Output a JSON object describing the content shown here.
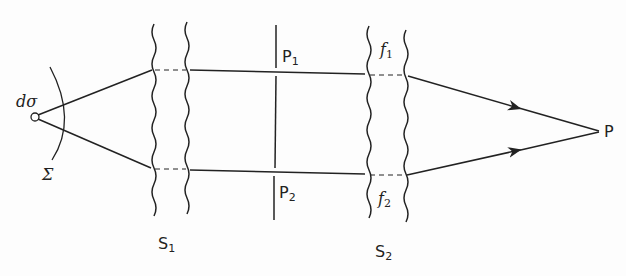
{
  "diagram": {
    "source": {
      "label_symbol": "dσ",
      "surface_label": "Σ"
    },
    "screens": [
      {
        "label": "S",
        "subscript": "1"
      },
      {
        "label": "S",
        "subscript": "2"
      }
    ],
    "pinholes": [
      {
        "label": "P",
        "subscript": "1"
      },
      {
        "label": "P",
        "subscript": "2"
      }
    ],
    "filters": [
      {
        "label": "f",
        "subscript": "1"
      },
      {
        "label": "f",
        "subscript": "2"
      }
    ],
    "observation_point": {
      "label": "P"
    },
    "colors": {
      "ink": "#222222",
      "background": "#fdfdfd"
    }
  }
}
